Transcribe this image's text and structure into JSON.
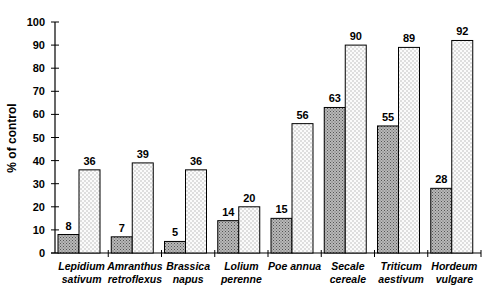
{
  "chart_data": {
    "type": "bar",
    "title": "",
    "xlabel": "",
    "ylabel": "% of control",
    "ylim": [
      0,
      100
    ],
    "yticks": [
      0,
      10,
      20,
      30,
      40,
      50,
      60,
      70,
      80,
      90,
      100
    ],
    "grid": false,
    "legend": null,
    "categories": [
      [
        "Lepidium",
        "sativum"
      ],
      [
        "Amranthus",
        "retroflexus"
      ],
      [
        "Brassica",
        "napus"
      ],
      [
        "Lolium",
        "perenne"
      ],
      [
        "Poe annua"
      ],
      [
        "Secale",
        "cereale"
      ],
      [
        "Triticum",
        "aestivum"
      ],
      [
        "Hordeum",
        "vulgare"
      ]
    ],
    "series": [
      {
        "name": "series-1 (dense stipple)",
        "values": [
          8,
          7,
          5,
          14,
          15,
          63,
          55,
          28
        ]
      },
      {
        "name": "series-2 (light dots)",
        "values": [
          36,
          39,
          36,
          20,
          56,
          90,
          89,
          92
        ]
      }
    ]
  }
}
